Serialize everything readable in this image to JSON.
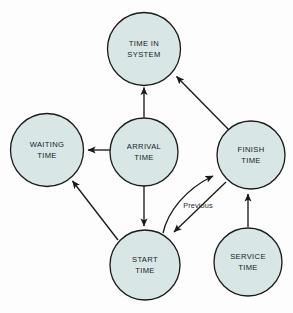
{
  "diagram": {
    "background_color": "#fdfdfd",
    "node_fill_color": "#d8e7e5",
    "node_stroke_color": "#1a1a1a",
    "edge_color": "#1a1a1a",
    "nodes": [
      {
        "id": "time-in-system",
        "line1": "TIME IN",
        "line2": "SYSTEM",
        "cx": 144,
        "cy": 49,
        "r": 36.5
      },
      {
        "id": "waiting-time",
        "line1": "WAITING",
        "line2": "TIME",
        "cx": 47,
        "cy": 150,
        "r": 36.5
      },
      {
        "id": "arrival-time",
        "line1": "ARRIVAL",
        "line2": "TIME",
        "cx": 144,
        "cy": 152,
        "r": 34
      },
      {
        "id": "finish-time",
        "line1": "FINISH",
        "line2": "TIME",
        "cx": 251,
        "cy": 155,
        "r": 34
      },
      {
        "id": "start-time",
        "line1": "START",
        "line2": "TIME",
        "cx": 145,
        "cy": 265,
        "r": 35
      },
      {
        "id": "service-time",
        "line1": "SERVICE",
        "line2": "TIME",
        "cx": 248,
        "cy": 262,
        "r": 34
      }
    ],
    "edges": [
      {
        "id": "arrival-to-time-in-system",
        "from": "arrival-time",
        "to": "time-in-system"
      },
      {
        "id": "finish-to-time-in-system",
        "from": "finish-time",
        "to": "time-in-system"
      },
      {
        "id": "arrival-to-waiting",
        "from": "arrival-time",
        "to": "waiting-time"
      },
      {
        "id": "arrival-to-start",
        "from": "arrival-time",
        "to": "start-time"
      },
      {
        "id": "start-to-waiting",
        "from": "start-time",
        "to": "waiting-time"
      },
      {
        "id": "start-to-finish",
        "from": "start-time",
        "to": "finish-time"
      },
      {
        "id": "finish-to-start-previous",
        "from": "finish-time",
        "to": "start-time",
        "label": "Previous"
      },
      {
        "id": "service-to-finish",
        "from": "service-time",
        "to": "finish-time"
      }
    ],
    "edge_labels": {
      "previous": "Previous"
    }
  }
}
